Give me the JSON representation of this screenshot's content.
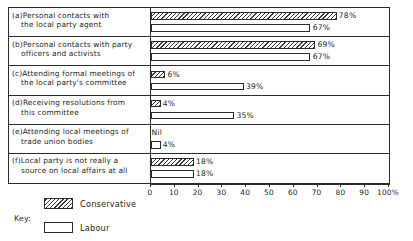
{
  "chart_data": {
    "type": "bar",
    "orientation": "horizontal",
    "title": "",
    "xlabel": "",
    "ylabel": "",
    "xlim": [
      0,
      100
    ],
    "grid": false,
    "legend_position": "bottom-left",
    "axis_unit": "%",
    "categories": [
      "(a)Personal contacts with the local party agent",
      "(b)Personal contacts with party officers and activists",
      "(c)Attending formal meetings of the local party's committee",
      "(d)Receiving resolutions from this committee",
      "(e)Attending local meetings of trade union bodies",
      "(f)Local party is not really a source on local affairs at all"
    ],
    "series": [
      {
        "name": "Conservative",
        "values": [
          78,
          69,
          6,
          4,
          0,
          18
        ],
        "labels": [
          "78%",
          "69%",
          "6%",
          "4%",
          "Nil",
          "18%"
        ]
      },
      {
        "name": "Labour",
        "values": [
          67,
          67,
          39,
          35,
          4,
          18
        ],
        "labels": [
          "67%",
          "67%",
          "39%",
          "35%",
          "4%",
          "18%"
        ]
      }
    ],
    "tick_labels": [
      "0",
      "10",
      "20",
      "30",
      "40",
      "50",
      "60",
      "70",
      "80",
      "90",
      "100%"
    ],
    "tick_values": [
      0,
      10,
      20,
      30,
      40,
      50,
      60,
      70,
      80,
      90,
      100
    ],
    "colors": {
      "conservative_fill": "#ffffff",
      "conservative_hatch": "#3a3a3a",
      "labour_fill": "#ffffff",
      "outline": "#2b2b2b",
      "text": "#1f1f1f",
      "background": "#ffffff"
    }
  },
  "rows": [
    {
      "line1": "(a)Personal contacts with",
      "line2": "the local party agent",
      "conservative": {
        "value": 78,
        "label": "78%"
      },
      "labour": {
        "value": 67,
        "label": "67%"
      }
    },
    {
      "line1": "(b)Personal contacts with party",
      "line2": "officers and activists",
      "conservative": {
        "value": 69,
        "label": "69%"
      },
      "labour": {
        "value": 67,
        "label": "67%"
      }
    },
    {
      "line1": "(c)Attending formal meetings of",
      "line2": "the local party's committee",
      "conservative": {
        "value": 6,
        "label": "6%"
      },
      "labour": {
        "value": 39,
        "label": "39%"
      }
    },
    {
      "line1": "(d)Receiving resolutions from",
      "line2": "this committee",
      "conservative": {
        "value": 4,
        "label": "4%"
      },
      "labour": {
        "value": 35,
        "label": "35%"
      }
    },
    {
      "line1": "(e)Attending local meetings of",
      "line2": "trade union bodies",
      "conservative": {
        "value": 0,
        "label": "Nil"
      },
      "labour": {
        "value": 4,
        "label": "4%"
      }
    },
    {
      "line1": "(f)Local party is not really a",
      "line2": "source on local affairs at all",
      "conservative": {
        "value": 18,
        "label": "18%"
      },
      "labour": {
        "value": 18,
        "label": "18%"
      }
    }
  ],
  "axis": {
    "ticks": [
      {
        "value": 0,
        "label": "0"
      },
      {
        "value": 10,
        "label": "10"
      },
      {
        "value": 20,
        "label": "20"
      },
      {
        "value": 30,
        "label": "30"
      },
      {
        "value": 40,
        "label": "40"
      },
      {
        "value": 50,
        "label": "50"
      },
      {
        "value": 60,
        "label": "60"
      },
      {
        "value": 70,
        "label": "70"
      },
      {
        "value": 80,
        "label": "80"
      },
      {
        "value": 90,
        "label": "90"
      },
      {
        "value": 100,
        "label": "100%"
      }
    ]
  },
  "legend": {
    "title": "Key:",
    "items": [
      {
        "label": "Conservative",
        "style": "hatched"
      },
      {
        "label": "Labour",
        "style": "outline"
      }
    ]
  }
}
